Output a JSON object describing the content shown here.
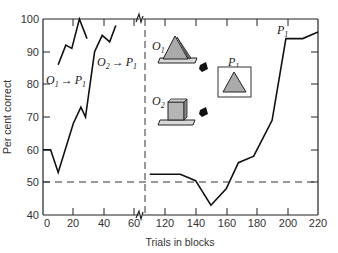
{
  "chart_data": {
    "type": "line",
    "title": "",
    "xlabel": "Trials in blocks",
    "ylabel": "Per cent correct",
    "ylim": [
      40,
      100
    ],
    "xlim_left_panel": [
      0,
      65
    ],
    "xlim_right_panel": [
      110,
      220
    ],
    "x_axis_break": true,
    "y_ticks": [
      40,
      50,
      60,
      70,
      80,
      90,
      100
    ],
    "x_ticks": [
      0,
      20,
      40,
      60,
      120,
      140,
      160,
      180,
      200,
      220
    ],
    "grid": false,
    "reference_line": {
      "y": 50,
      "style": "dashed",
      "label": "chance"
    },
    "panel_divider": {
      "style": "dashed vertical",
      "between": [
        65,
        110
      ]
    },
    "series": [
      {
        "name": "O1 → P1",
        "x": [
          10,
          15,
          19,
          24,
          29
        ],
        "y": [
          86,
          92,
          91,
          100,
          94
        ]
      },
      {
        "name": "O2 → P1",
        "x": [
          0,
          5,
          10,
          20,
          25,
          28,
          34,
          39,
          44,
          48
        ],
        "y": [
          60,
          60,
          53,
          68,
          73,
          70,
          90,
          95,
          93,
          98
        ]
      },
      {
        "name": "P1",
        "x": [
          110,
          130,
          140,
          150,
          160,
          168,
          178,
          190,
          199,
          210,
          220
        ],
        "y": [
          52.5,
          52.5,
          50.5,
          43,
          48,
          56,
          58,
          69,
          94,
          94,
          96
        ]
      }
    ],
    "annotations": [
      {
        "text": "O1 → P1",
        "near": "left panel, upper curve"
      },
      {
        "text": "O2 → P1",
        "near": "left panel, second curve"
      },
      {
        "text": "P1",
        "near": "right panel curve end"
      }
    ],
    "inset_illustration": {
      "objects": [
        {
          "label": "O1",
          "shape": "triangle on base plate"
        },
        {
          "label": "O2",
          "shape": "cube on base plate"
        },
        {
          "label": "P1",
          "shape": "triangle in framed picture"
        }
      ]
    }
  },
  "labels": {
    "xlabel": "Trials in blocks",
    "ylabel": "Per cent correct",
    "o1_main": "O",
    "o1_sub": "1",
    "o2_main": "O",
    "o2_sub": "2",
    "p_main": "P",
    "p_sub": "1",
    "arrow": "→"
  },
  "ticks": {
    "y": [
      "100",
      "90",
      "80",
      "70",
      "60",
      "50",
      "40"
    ],
    "x_left": [
      "0",
      "20",
      "40",
      "60"
    ],
    "x_right": [
      "120",
      "140",
      "160",
      "180",
      "200",
      "220"
    ]
  }
}
